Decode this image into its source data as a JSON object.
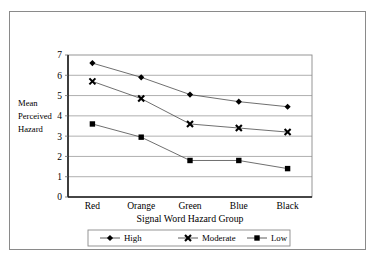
{
  "chart_data": {
    "type": "line",
    "title": "",
    "xlabel": "Signal Word Hazard Group",
    "ylabel": "Mean Perceived Hazard",
    "ylabel_lines": [
      "Mean",
      "Perceived",
      "Hazard"
    ],
    "categories": [
      "Red",
      "Orange",
      "Green",
      "Blue",
      "Black"
    ],
    "ylim": [
      0,
      7
    ],
    "yticks": [
      0,
      1,
      2,
      3,
      4,
      5,
      6,
      7
    ],
    "ytick_labels": [
      "0",
      "1",
      "2",
      "3",
      "4",
      "5",
      "6",
      "7"
    ],
    "grid": true,
    "grid_axis": "y",
    "legend_position": "bottom",
    "series": [
      {
        "name": "High",
        "marker": "diamond",
        "values": [
          6.6,
          5.9,
          5.05,
          4.7,
          4.45
        ]
      },
      {
        "name": "Moderate",
        "marker": "x",
        "values": [
          5.7,
          4.85,
          3.6,
          3.4,
          3.2
        ]
      },
      {
        "name": "Low",
        "marker": "square",
        "values": [
          3.6,
          2.95,
          1.8,
          1.8,
          1.4
        ]
      }
    ]
  },
  "legend": {
    "items": [
      {
        "label": "High",
        "marker": "diamond"
      },
      {
        "label": "Moderate",
        "marker": "x"
      },
      {
        "label": "Low",
        "marker": "square"
      }
    ]
  },
  "colors": {
    "marker": "#000000",
    "series_line": "#4a4a4a",
    "gridline": "#9a9a9a",
    "plot_border": "#8a8a8a",
    "axis": "#1a1a1a",
    "background": "#ffffff"
  }
}
